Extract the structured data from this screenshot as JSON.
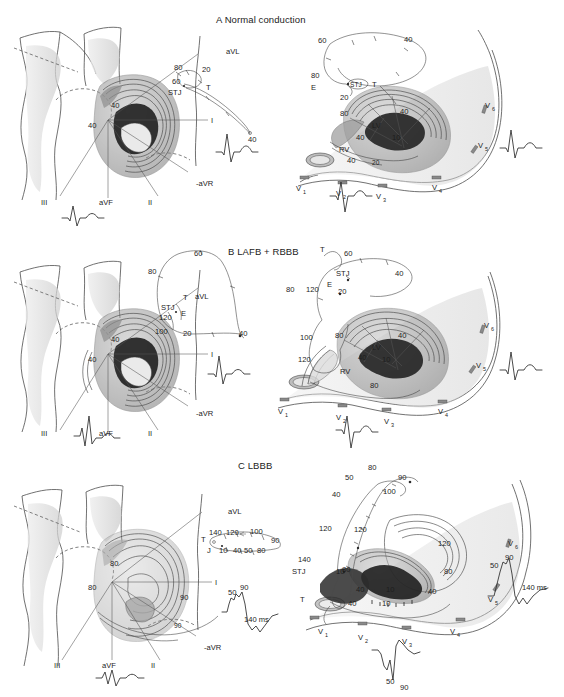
{
  "figure": {
    "panels": [
      {
        "id": "A",
        "title": "A Normal conduction",
        "frontal": {
          "view_name": "frontal-plane-view",
          "isochrone_labels": [
            "40",
            "40"
          ],
          "lead_axis_labels": [
            "aVL",
            "I",
            "-aVR",
            "II",
            "aVF",
            "III"
          ],
          "vector_loop_labels": [
            "80",
            "20",
            "60",
            "STJ",
            "T",
            "40"
          ],
          "ecg_leads": [
            "I",
            "aVF"
          ]
        },
        "horizontal": {
          "view_name": "horizontal-plane-view",
          "loop_labels": [
            "60",
            "40",
            "80",
            "E",
            "STJ",
            "T",
            "20"
          ],
          "isochrone_labels": [
            "80",
            "40",
            "40",
            "10",
            "20"
          ],
          "chamber_labels": [
            "LV",
            "RV"
          ],
          "precordial_leads": [
            "V1",
            "V2",
            "V3",
            "V4",
            "V5",
            "V6"
          ],
          "ecg_leads": [
            "V2",
            "V5"
          ]
        }
      },
      {
        "id": "B",
        "title": "B LAFB + RBBB",
        "frontal": {
          "view_name": "frontal-plane-view",
          "isochrone_labels": [
            "40",
            "40"
          ],
          "lead_axis_labels": [
            "aVL",
            "I",
            "-aVR",
            "II",
            "aVF",
            "III"
          ],
          "vector_loop_labels": [
            "60",
            "80",
            "STJ",
            "E",
            "T",
            "120",
            "100",
            "20",
            "40"
          ],
          "ecg_leads": [
            "I",
            "aVF"
          ]
        },
        "horizontal": {
          "view_name": "horizontal-plane-view",
          "loop_labels": [
            "T",
            "60",
            "STJ",
            "E",
            "40",
            "80",
            "120",
            "20",
            "100"
          ],
          "isochrone_labels": [
            "80",
            "40",
            "40",
            "10",
            "80",
            "120"
          ],
          "chamber_labels": [
            "LV",
            "RV"
          ],
          "precordial_leads": [
            "V1",
            "V2",
            "V3",
            "V4",
            "V5",
            "V6"
          ],
          "ecg_leads": [
            "V2",
            "V5"
          ]
        }
      },
      {
        "id": "C",
        "title": "C LBBB",
        "frontal": {
          "view_name": "frontal-plane-view",
          "isochrone_labels": [
            "80",
            "80",
            "90",
            "90"
          ],
          "lead_axis_labels": [
            "aVL",
            "I",
            "-aVR",
            "II",
            "aVF",
            "III"
          ],
          "vector_loop_labels": [
            "140",
            "120",
            "100",
            "90",
            "T",
            "J",
            "10",
            "40",
            "50",
            "80"
          ],
          "ecg_leads": [
            "I",
            "aVF"
          ],
          "ecg_annotations": [
            "50",
            "90",
            "140 ms"
          ]
        },
        "horizontal": {
          "view_name": "horizontal-plane-view",
          "loop_labels": [
            "80",
            "50",
            "90",
            "40",
            "100",
            "120",
            "140",
            "STJ",
            "10",
            "T"
          ],
          "isochrone_labels": [
            "120",
            "120",
            "80",
            "80",
            "40",
            "40",
            "10",
            "10",
            "40"
          ],
          "precordial_leads": [
            "V1",
            "V2",
            "V3",
            "V4",
            "V5",
            "V6"
          ],
          "ecg_leads": [
            "V2",
            "V6"
          ],
          "ecg_annotations": [
            "50",
            "90",
            "50",
            "90",
            "140 ms"
          ]
        }
      }
    ],
    "units": "ms",
    "colors": {
      "ink": "#1d1d1d",
      "line": "#4a4a4a",
      "tissue_light": "#d8d8d8",
      "tissue_mid": "#9a9a9a",
      "tissue_dark": "#2e2e2e"
    }
  }
}
